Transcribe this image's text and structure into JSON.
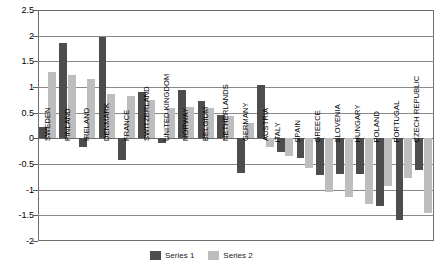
{
  "chart_data": {
    "type": "bar",
    "title": "",
    "xlabel": "",
    "ylabel": "",
    "ylim": [
      -2,
      2.5
    ],
    "ytick_labels": [
      "2.5",
      "2",
      "1.5",
      "1",
      "0.5",
      "0",
      "-0.5",
      "-1",
      "-1.5",
      "-2"
    ],
    "ytick_values": [
      2.5,
      2,
      1.5,
      1,
      0.5,
      0,
      -0.5,
      -1,
      -1.5,
      -2
    ],
    "grid": true,
    "legend_position": "bottom",
    "categories": [
      "SWEDEN",
      "FINLAND",
      "IRELAND",
      "DENMARK",
      "FRANCE",
      "SWITZERLAND",
      "UNITED KINGDOM",
      "NORWAY",
      "BELGIUM",
      "NETHERLANDS",
      "GERMANY",
      "AUSTRIA",
      "ITALY",
      "SPAIN",
      "GREECE",
      "SLOVENIA",
      "HUNGARY",
      "POLAND",
      "PORTUGAL",
      "CZECH REPUBLIC"
    ],
    "series": [
      {
        "name": "Series 1",
        "color": "#4d4d4d",
        "values": [
          0.22,
          1.86,
          -0.17,
          1.97,
          -0.43,
          0.9,
          -0.09,
          0.95,
          0.73,
          0.45,
          -0.68,
          1.04,
          -0.27,
          -0.38,
          -0.72,
          -0.69,
          -0.7,
          -1.32,
          -1.6,
          -0.62
        ]
      },
      {
        "name": "Series 2",
        "color": "#bdbdbd",
        "values": [
          1.29,
          1.24,
          1.15,
          0.86,
          0.83,
          0.75,
          0.6,
          0.61,
          0.6,
          0.44,
          0.3,
          -0.17,
          -0.35,
          -0.58,
          -1.04,
          -1.14,
          -1.28,
          -0.92,
          -0.77,
          -1.45
        ]
      }
    ]
  },
  "legend": {
    "items": [
      {
        "label": "Series 1"
      },
      {
        "label": "Series 2"
      }
    ]
  }
}
